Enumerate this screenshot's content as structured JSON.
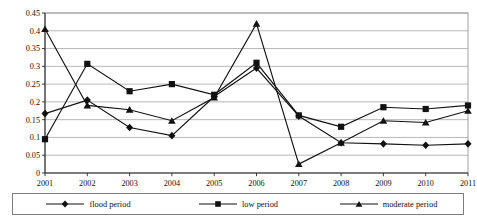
{
  "chart_data": {
    "type": "line",
    "title": "",
    "subtitle": "",
    "xlabel": "",
    "ylabel": "",
    "categories": [
      "2001",
      "2002",
      "2003",
      "2004",
      "2005",
      "2006",
      "2007",
      "2008",
      "2009",
      "2010",
      "2011"
    ],
    "x": [
      2001,
      2002,
      2003,
      2004,
      2005,
      2006,
      2007,
      2008,
      2009,
      2010,
      2011
    ],
    "ylim": [
      0,
      0.45
    ],
    "xlim": [
      2001,
      2011
    ],
    "ytick_labels": [
      "0",
      "0.05",
      "0.1",
      "0.15",
      "0.2",
      "0.25",
      "0.3",
      "0.35",
      "0.4",
      "0.45"
    ],
    "ytick_values": [
      0,
      0.05,
      0.1,
      0.15,
      0.2,
      0.25,
      0.3,
      0.35,
      0.4,
      0.45
    ],
    "xtick_labels": [
      "2001",
      "2002",
      "2003",
      "2004",
      "2005",
      "2006",
      "2007",
      "2008",
      "2009",
      "2010",
      "2011"
    ],
    "grid": true,
    "grid_axis": "y",
    "legend_position": "bottom",
    "series": [
      {
        "name": "flood period",
        "marker": "diamond",
        "color": "#111111",
        "values": [
          0.167,
          0.205,
          0.128,
          0.105,
          0.215,
          0.295,
          0.16,
          0.085,
          0.082,
          0.078,
          0.082
        ]
      },
      {
        "name": "low period",
        "marker": "square",
        "color": "#111111",
        "values": [
          0.095,
          0.307,
          0.23,
          0.25,
          0.22,
          0.31,
          0.162,
          0.13,
          0.185,
          0.18,
          0.19
        ]
      },
      {
        "name": "moderate period",
        "marker": "triangle",
        "color": "#111111",
        "values": [
          0.405,
          0.19,
          0.178,
          0.147,
          0.212,
          0.42,
          0.025,
          0.085,
          0.147,
          0.142,
          0.175
        ]
      }
    ]
  },
  "legend": {
    "items": [
      {
        "label": "flood period",
        "marker": "diamond"
      },
      {
        "label": "low period",
        "marker": "square"
      },
      {
        "label": "moderate period",
        "marker": "triangle"
      }
    ]
  }
}
